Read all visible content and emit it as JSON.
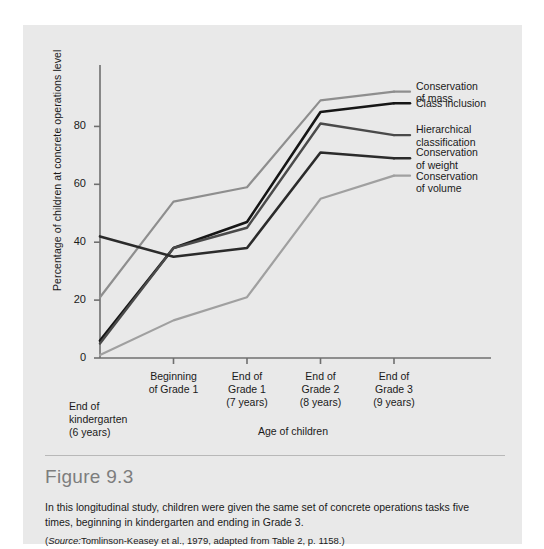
{
  "figure": {
    "number": "Figure 9.3",
    "caption": "In this longitudinal study, children were given the same set of concrete operations tasks five times, beginning in kindergarten and ending in Grade 3.",
    "source_prefix": "Source:",
    "source_text": "Tomlinson-Keasey et al., 1979, adapted from Table 2, p. 1158.",
    "source_open": "(",
    "source_close": ")"
  },
  "chart_data": {
    "type": "line",
    "title": "",
    "xlabel": "Age of children",
    "ylabel": "Percentage of children at concrete operations level",
    "categories": [
      "End of\nkindergarten\n(6 years)",
      "Beginning\nof Grade 1",
      "End of\nGrade 1\n(7 years)",
      "End of\nGrade 2\n(8 years)",
      "End of\nGrade 3\n(9 years)"
    ],
    "x": [
      0,
      1,
      2,
      3,
      4
    ],
    "ylim": [
      0,
      95
    ],
    "xlim": [
      -0.08,
      4.0
    ],
    "yticks": [
      0,
      20,
      40,
      60,
      80
    ],
    "ytick_labels": [
      "0",
      "20",
      "40",
      "60",
      "80"
    ],
    "grid": false,
    "legend_position": "right-of-lines",
    "series": [
      {
        "name": "Conservation of mass",
        "label": "Conservation\nof mass",
        "color": "#8e8e8e",
        "width": 2.2,
        "values": [
          21,
          54,
          59,
          89,
          92
        ]
      },
      {
        "name": "Class inclusion",
        "label": "Class inclusion",
        "color": "#161616",
        "width": 2.6,
        "values": [
          6,
          38,
          47,
          85,
          88
        ]
      },
      {
        "name": "Hierarchical classification",
        "label": "Hierarchical\nclassification",
        "color": "#4a4a4a",
        "width": 2.4,
        "values": [
          5,
          38,
          45,
          81,
          77
        ]
      },
      {
        "name": "Conservation of weight",
        "label": "Conservation\nof weight",
        "color": "#2b2b2b",
        "width": 2.6,
        "values": [
          42,
          35,
          38,
          71,
          69
        ]
      },
      {
        "name": "Conservation of volume",
        "label": "Conservation\nof volume",
        "color": "#a0a0a0",
        "width": 2.2,
        "values": [
          1,
          13,
          21,
          55,
          63
        ]
      }
    ],
    "axis_color": "#6f6f6f"
  },
  "legend_labels": [
    "Conservation\nof mass",
    "Class inclusion",
    "Hierarchical\nclassification",
    "Conservation\nof weight",
    "Conservation\nof volume"
  ]
}
